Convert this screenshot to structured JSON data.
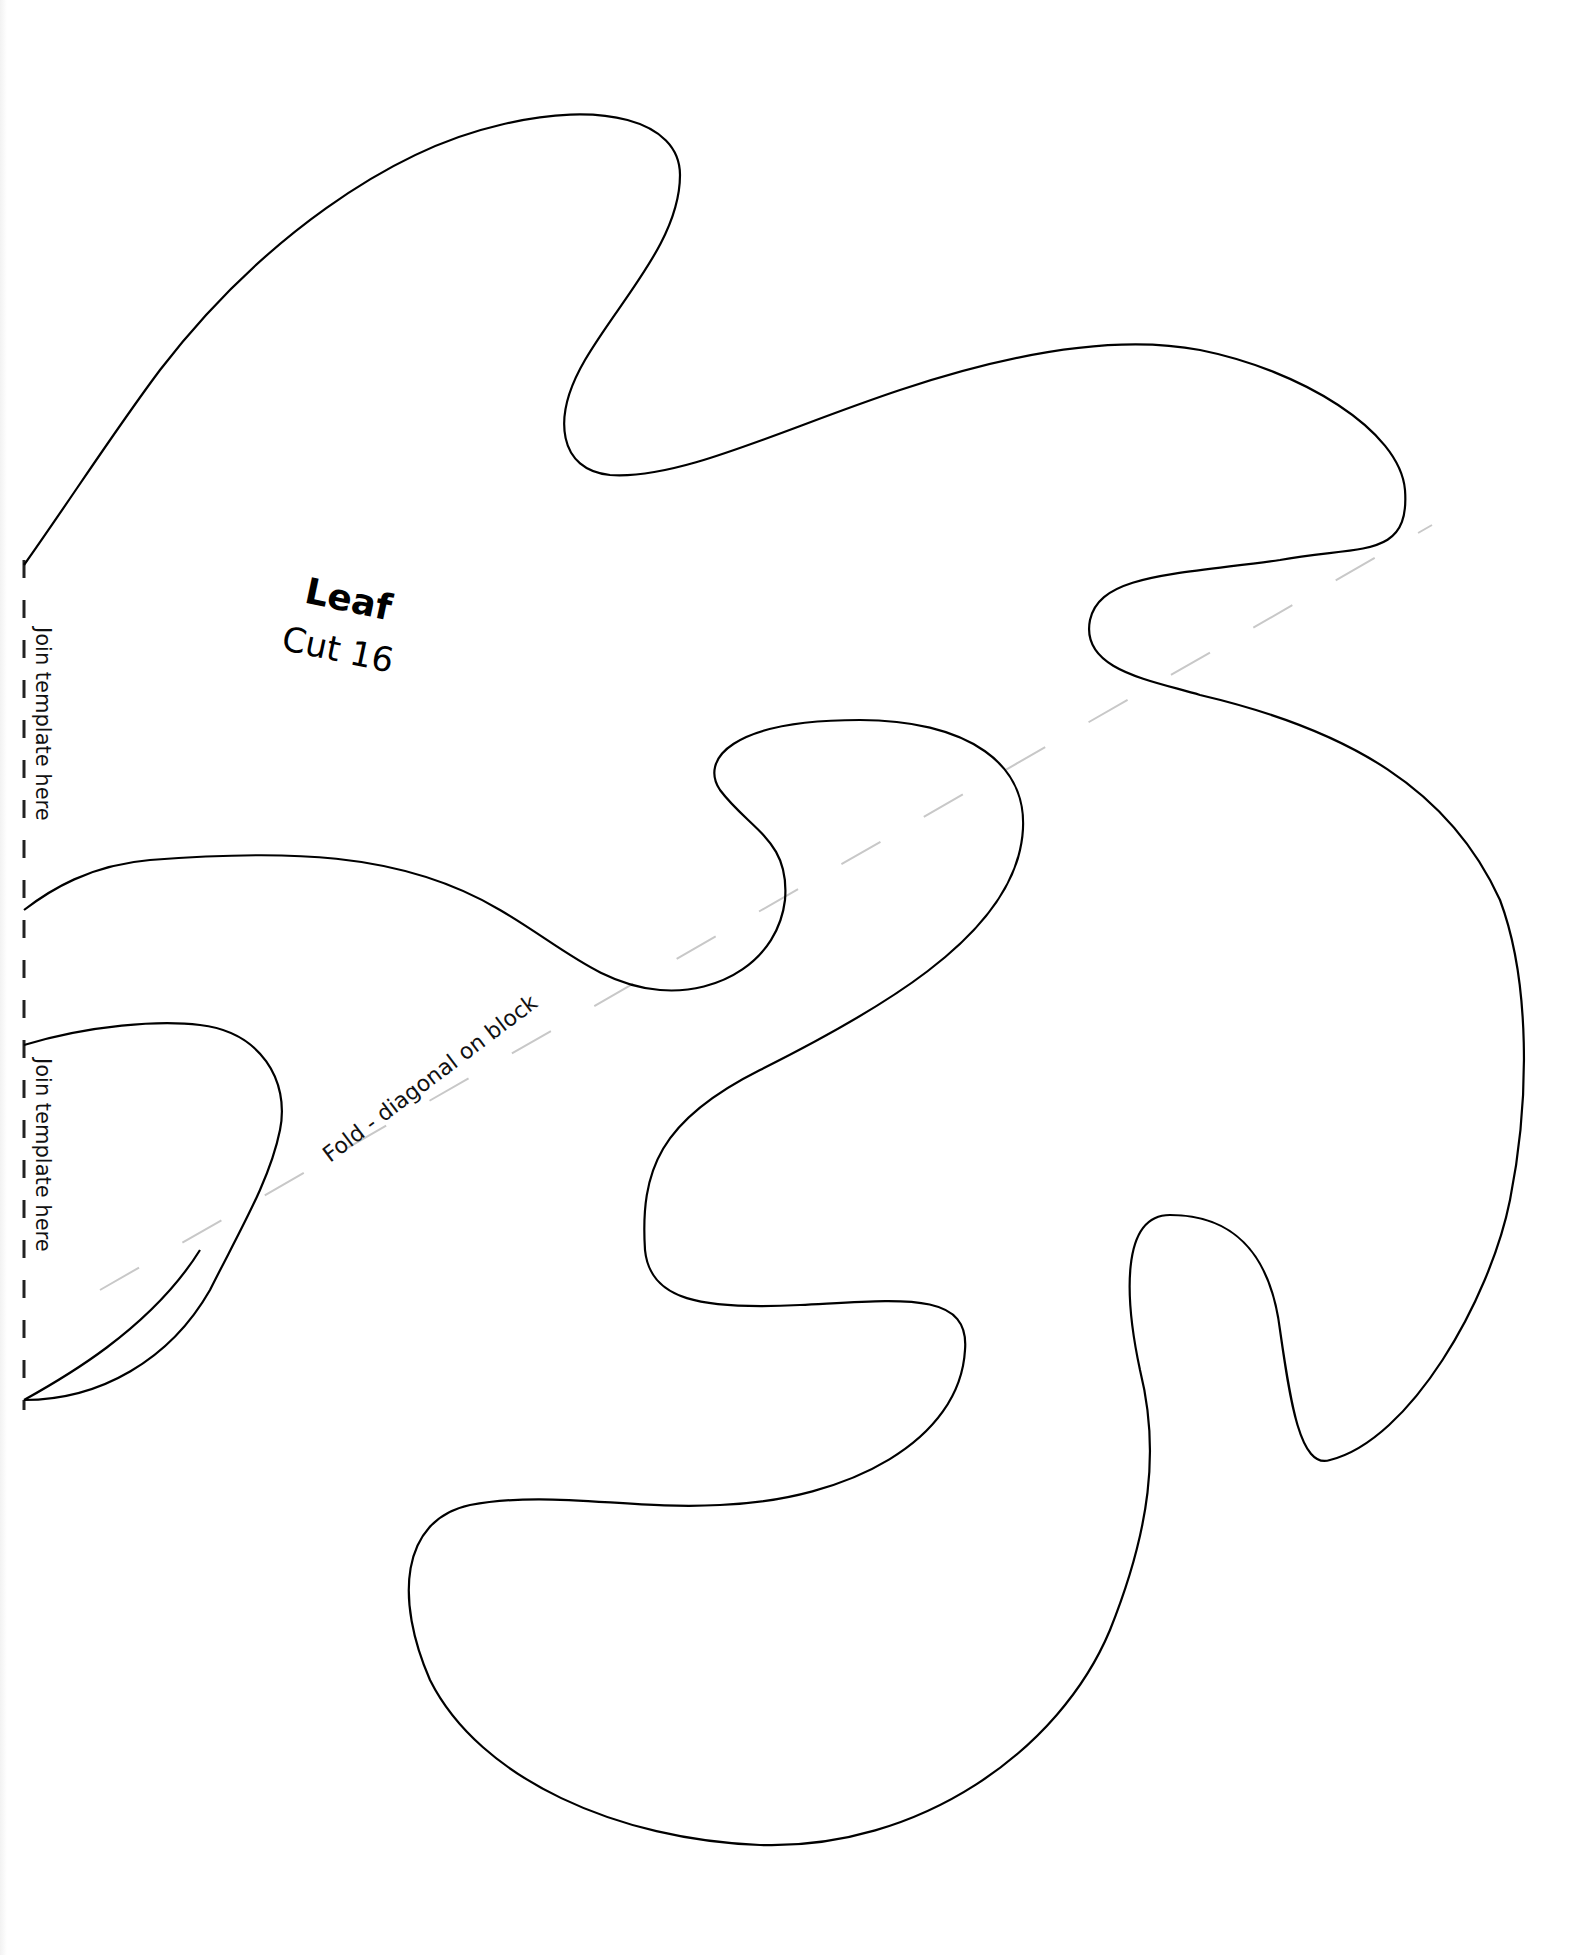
{
  "template": {
    "title": "Leaf",
    "instruction": "Cut 16",
    "join_label_top": "Join template here",
    "join_label_bottom": "Join template here",
    "fold_label": "Fold - diagonal on block"
  },
  "colors": {
    "outline": "#000000",
    "fold_line": "#c8c8c8",
    "background": "#ffffff"
  }
}
